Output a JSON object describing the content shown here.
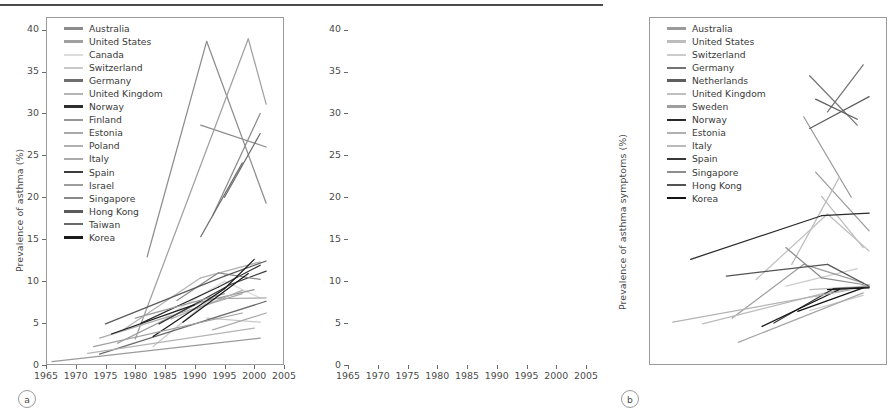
{
  "figure": {
    "panels": [
      "a",
      "b"
    ],
    "tag_a": "a",
    "tag_b": "b",
    "top_rule_color": "#4a4a4a"
  },
  "panel_a": {
    "tag": "a",
    "ylabel": "Prevalence of asthma (%)",
    "xlabel": "",
    "yticks": [
      "0",
      "5",
      "10",
      "15",
      "20",
      "25",
      "30",
      "35",
      "40"
    ],
    "xticks": [
      "1965",
      "1970",
      "1975",
      "1980",
      "1985",
      "1990",
      "1995",
      "2000",
      "2005"
    ],
    "legend": [
      {
        "label": "Australia",
        "color": "#8c8c8c"
      },
      {
        "label": "United States",
        "color": "#a0a0a0"
      },
      {
        "label": "Canada",
        "color": "#dcdcdc"
      },
      {
        "label": "Switzerland",
        "color": "#c8c8c8"
      },
      {
        "label": "Germany",
        "color": "#6e6e6e"
      },
      {
        "label": "United Kingdom",
        "color": "#b4b4b4"
      },
      {
        "label": "Norway",
        "color": "#2e2e2e"
      },
      {
        "label": "Finland",
        "color": "#969696"
      },
      {
        "label": "Estonia",
        "color": "#a8a8a8"
      },
      {
        "label": "Poland",
        "color": "#b0b0b0"
      },
      {
        "label": "Italy",
        "color": "#aaaaaa"
      },
      {
        "label": "Spain",
        "color": "#3c3c3c"
      },
      {
        "label": "Israel",
        "color": "#9c9c9c"
      },
      {
        "label": "Singapore",
        "color": "#8a8a8a"
      },
      {
        "label": "Hong Kong",
        "color": "#5a5a5a"
      },
      {
        "label": "Taiwan",
        "color": "#6a6a6a"
      },
      {
        "label": "Korea",
        "color": "#1a1a1a"
      }
    ]
  },
  "panel_b": {
    "tag": "b",
    "ylabel": "Prevalence of asthma symptoms (%)",
    "xlabel": "",
    "yticks": [
      "0",
      "5",
      "10",
      "15",
      "20",
      "25",
      "30",
      "35",
      "40"
    ],
    "xticks": [
      "1965",
      "1970",
      "1975",
      "1980",
      "1985",
      "1990",
      "1995",
      "2000",
      "2005"
    ],
    "legend": [
      {
        "label": "Australia",
        "color": "#9a9a9a"
      },
      {
        "label": "United States",
        "color": "#bcbcbc"
      },
      {
        "label": "Switzerland",
        "color": "#cccccc"
      },
      {
        "label": "Germany",
        "color": "#747474"
      },
      {
        "label": "Netherlands",
        "color": "#5e5e5e"
      },
      {
        "label": "United Kingdom",
        "color": "#c0c0c0"
      },
      {
        "label": "Sweden",
        "color": "#9e9e9e"
      },
      {
        "label": "Norway",
        "color": "#2a2a2a"
      },
      {
        "label": "Estonia",
        "color": "#b0b0b0"
      },
      {
        "label": "Italy",
        "color": "#bababa"
      },
      {
        "label": "Spain",
        "color": "#383838"
      },
      {
        "label": "Singapore",
        "color": "#8e8e8e"
      },
      {
        "label": "Hong Kong",
        "color": "#525252"
      },
      {
        "label": "Korea",
        "color": "#141414"
      }
    ]
  },
  "chart_data": [
    {
      "type": "line",
      "panel": "a",
      "title": "",
      "xlabel": "",
      "ylabel": "Prevalence of asthma (%)",
      "xlim": [
        1965,
        2005
      ],
      "ylim": [
        0,
        41.5
      ],
      "grid": false,
      "legend_position": "upper-left",
      "series": [
        {
          "name": "Australia",
          "color": "#8c8c8c",
          "x": [
            1982,
            1992
          ],
          "y": [
            12.9,
            38.6
          ]
        },
        {
          "name": "Australia",
          "color": "#8c8c8c",
          "x": [
            1992,
            2002
          ],
          "y": [
            38.6,
            19.3
          ]
        },
        {
          "name": "Australia",
          "color": "#8c8c8c",
          "x": [
            1991,
            2002
          ],
          "y": [
            28.6,
            26.0
          ]
        },
        {
          "name": "Australia",
          "color": "#8c8c8c",
          "x": [
            1993,
            2001
          ],
          "y": [
            17.8,
            30.0
          ]
        },
        {
          "name": "United States",
          "color": "#a0a0a0",
          "x": [
            1980,
            1999
          ],
          "y": [
            3.1,
            38.9
          ]
        },
        {
          "name": "United States",
          "color": "#a0a0a0",
          "x": [
            1999,
            2002
          ],
          "y": [
            38.9,
            31.1
          ]
        },
        {
          "name": "Canada",
          "color": "#dcdcdc",
          "x": [
            1985,
            1995
          ],
          "y": [
            5.7,
            10.0
          ]
        },
        {
          "name": "Canada",
          "color": "#dcdcdc",
          "x": [
            1995,
            2001
          ],
          "y": [
            10.0,
            8.0
          ]
        },
        {
          "name": "Switzerland",
          "color": "#c8c8c8",
          "x": [
            1983,
            1995
          ],
          "y": [
            2.2,
            9.2
          ]
        },
        {
          "name": "Switzerland",
          "color": "#c8c8c8",
          "x": [
            1992,
            2001
          ],
          "y": [
            5.6,
            5.1
          ]
        },
        {
          "name": "Germany",
          "color": "#6e6e6e",
          "x": [
            1991,
            1998
          ],
          "y": [
            15.3,
            24.1
          ]
        },
        {
          "name": "Germany",
          "color": "#6e6e6e",
          "x": [
            1995,
            2001
          ],
          "y": [
            20.0,
            27.6
          ]
        },
        {
          "name": "United Kingdom",
          "color": "#b4b4b4",
          "x": [
            1978,
            1991
          ],
          "y": [
            4.2,
            10.4
          ]
        },
        {
          "name": "United Kingdom",
          "color": "#b4b4b4",
          "x": [
            1991,
            2001
          ],
          "y": [
            10.4,
            12.3
          ]
        },
        {
          "name": "Norway",
          "color": "#2e2e2e",
          "x": [
            1981,
            1994
          ],
          "y": [
            5.0,
            9.3
          ]
        },
        {
          "name": "Norway",
          "color": "#2e2e2e",
          "x": [
            1994,
            2001
          ],
          "y": [
            9.3,
            11.9
          ]
        },
        {
          "name": "Finland",
          "color": "#969696",
          "x": [
            1977,
            1991
          ],
          "y": [
            2.6,
            7.5
          ]
        },
        {
          "name": "Finland",
          "color": "#969696",
          "x": [
            1991,
            2000
          ],
          "y": [
            7.5,
            9.0
          ]
        },
        {
          "name": "Estonia",
          "color": "#a8a8a8",
          "x": [
            1993,
            2002
          ],
          "y": [
            4.2,
            6.2
          ]
        },
        {
          "name": "Poland",
          "color": "#b0b0b0",
          "x": [
            1986,
            1998
          ],
          "y": [
            5.5,
            8.9
          ]
        },
        {
          "name": "Italy",
          "color": "#aaaaaa",
          "x": [
            1974,
            1998
          ],
          "y": [
            3.2,
            8.5
          ]
        },
        {
          "name": "Italy",
          "color": "#aaaaaa",
          "x": [
            1992,
            2002
          ],
          "y": [
            7.9,
            8.0
          ]
        },
        {
          "name": "Spain",
          "color": "#3c3c3c",
          "x": [
            1984,
            1996
          ],
          "y": [
            4.9,
            9.6
          ]
        },
        {
          "name": "Spain",
          "color": "#3c3c3c",
          "x": [
            1996,
            2002
          ],
          "y": [
            9.6,
            11.2
          ]
        },
        {
          "name": "Israel",
          "color": "#9c9c9c",
          "x": [
            1980,
            1995
          ],
          "y": [
            5.6,
            8.5
          ]
        },
        {
          "name": "Singapore",
          "color": "#8a8a8a",
          "x": [
            1987,
            1994
          ],
          "y": [
            7.7,
            11.0
          ]
        },
        {
          "name": "Singapore",
          "color": "#8a8a8a",
          "x": [
            1994,
            2001
          ],
          "y": [
            11.0,
            10.2
          ]
        },
        {
          "name": "Hong Kong",
          "color": "#5a5a5a",
          "x": [
            1975,
            1995
          ],
          "y": [
            4.9,
            10.6
          ]
        },
        {
          "name": "Hong Kong",
          "color": "#5a5a5a",
          "x": [
            1995,
            2002
          ],
          "y": [
            10.6,
            12.4
          ]
        },
        {
          "name": "Taiwan",
          "color": "#6a6a6a",
          "x": [
            1974,
            1994
          ],
          "y": [
            1.3,
            5.8
          ]
        },
        {
          "name": "Taiwan",
          "color": "#6a6a6a",
          "x": [
            1994,
            2002
          ],
          "y": [
            5.8,
            7.6
          ]
        },
        {
          "name": "Korea",
          "color": "#1a1a1a",
          "x": [
            1983,
            1995
          ],
          "y": [
            3.4,
            9.1
          ]
        },
        {
          "name": "Korea",
          "color": "#1a1a1a",
          "x": [
            1995,
            2000
          ],
          "y": [
            9.1,
            12.6
          ]
        },
        {
          "name": "Korea",
          "color": "#1a1a1a",
          "x": [
            1988,
            1999
          ],
          "y": [
            5.1,
            10.9
          ]
        },
        {
          "name": "Korea",
          "color": "#1a1a1a",
          "x": [
            1976,
            1990
          ],
          "y": [
            3.7,
            7.2
          ]
        },
        {
          "name": "trend-low",
          "color": "#9a9a9a",
          "x": [
            1966,
            2001
          ],
          "y": [
            0.4,
            3.2
          ]
        },
        {
          "name": "trend-low2",
          "color": "#b4b4b4",
          "x": [
            1972,
            2000
          ],
          "y": [
            1.4,
            4.4
          ]
        },
        {
          "name": "trend-mid",
          "color": "#a0a0a0",
          "x": [
            1973,
            1998
          ],
          "y": [
            2.2,
            6.2
          ]
        }
      ]
    },
    {
      "type": "line",
      "panel": "b",
      "title": "",
      "xlabel": "",
      "ylabel": "Prevalence of asthma symptoms (%)",
      "xlim": [
        1965,
        2005
      ],
      "ylim": [
        0,
        41.5
      ],
      "grid": false,
      "legend_position": "upper-left",
      "series": [
        {
          "name": "Australia",
          "color": "#9a9a9a",
          "x": [
            1991,
            1999
          ],
          "y": [
            29.6,
            20.0
          ]
        },
        {
          "name": "Australia",
          "color": "#9a9a9a",
          "x": [
            1993,
            2002
          ],
          "y": [
            23.0,
            16.0
          ]
        },
        {
          "name": "United States",
          "color": "#bcbcbc",
          "x": [
            1989,
            1997
          ],
          "y": [
            12.0,
            22.4
          ]
        },
        {
          "name": "United States",
          "color": "#bcbcbc",
          "x": [
            1994,
            2001
          ],
          "y": [
            20.1,
            14.0
          ]
        },
        {
          "name": "Switzerland",
          "color": "#cccccc",
          "x": [
            1988,
            2000
          ],
          "y": [
            9.4,
            11.5
          ]
        },
        {
          "name": "Switzerland",
          "color": "#cccccc",
          "x": [
            1992,
            2001
          ],
          "y": [
            6.5,
            8.3
          ]
        },
        {
          "name": "Germany",
          "color": "#747474",
          "x": [
            1992,
            2000
          ],
          "y": [
            34.5,
            28.6
          ]
        },
        {
          "name": "Germany",
          "color": "#747474",
          "x": [
            1995,
            2001
          ],
          "y": [
            30.2,
            35.8
          ]
        },
        {
          "name": "Netherlands",
          "color": "#5e5e5e",
          "x": [
            1993,
            2000
          ],
          "y": [
            31.7,
            29.3
          ]
        },
        {
          "name": "Netherlands",
          "color": "#5e5e5e",
          "x": [
            1992,
            2002
          ],
          "y": [
            28.2,
            32.0
          ]
        },
        {
          "name": "United Kingdom",
          "color": "#c0c0c0",
          "x": [
            1983,
            1995
          ],
          "y": [
            10.2,
            18.0
          ]
        },
        {
          "name": "United Kingdom",
          "color": "#c0c0c0",
          "x": [
            1995,
            2002
          ],
          "y": [
            18.0,
            13.6
          ]
        },
        {
          "name": "Sweden",
          "color": "#9e9e9e",
          "x": [
            1979,
            1991
          ],
          "y": [
            5.6,
            12.0
          ]
        },
        {
          "name": "Sweden",
          "color": "#9e9e9e",
          "x": [
            1991,
            2001
          ],
          "y": [
            12.0,
            9.8
          ]
        },
        {
          "name": "Norway",
          "color": "#2a2a2a",
          "x": [
            1972,
            1994
          ],
          "y": [
            12.6,
            17.8
          ]
        },
        {
          "name": "Norway",
          "color": "#2a2a2a",
          "x": [
            1994,
            2002
          ],
          "y": [
            17.8,
            18.1
          ]
        },
        {
          "name": "Estonia",
          "color": "#b0b0b0",
          "x": [
            1993,
            2002
          ],
          "y": [
            8.2,
            9.6
          ]
        },
        {
          "name": "Italy",
          "color": "#bababa",
          "x": [
            1974,
            1998
          ],
          "y": [
            4.9,
            9.2
          ]
        },
        {
          "name": "Italy",
          "color": "#bababa",
          "x": [
            1992,
            2002
          ],
          "y": [
            9.0,
            9.4
          ]
        },
        {
          "name": "Spain",
          "color": "#383838",
          "x": [
            1986,
            1996
          ],
          "y": [
            5.0,
            9.1
          ]
        },
        {
          "name": "Spain",
          "color": "#383838",
          "x": [
            1996,
            2002
          ],
          "y": [
            9.1,
            9.3
          ]
        },
        {
          "name": "Singapore",
          "color": "#8e8e8e",
          "x": [
            1988,
            1994
          ],
          "y": [
            14.0,
            10.4
          ]
        },
        {
          "name": "Singapore",
          "color": "#8e8e8e",
          "x": [
            1994,
            2001
          ],
          "y": [
            10.4,
            9.6
          ]
        },
        {
          "name": "Hong Kong",
          "color": "#525252",
          "x": [
            1978,
            1995
          ],
          "y": [
            10.6,
            12.0
          ]
        },
        {
          "name": "Hong Kong",
          "color": "#525252",
          "x": [
            1995,
            2002
          ],
          "y": [
            12.0,
            9.4
          ]
        },
        {
          "name": "Korea",
          "color": "#141414",
          "x": [
            1984,
            1997
          ],
          "y": [
            4.6,
            9.0
          ]
        },
        {
          "name": "Korea",
          "color": "#141414",
          "x": [
            1990,
            2001
          ],
          "y": [
            6.4,
            9.2
          ]
        },
        {
          "name": "Korea",
          "color": "#141414",
          "x": [
            1995,
            2002
          ],
          "y": [
            9.0,
            9.2
          ]
        },
        {
          "name": "trend-low",
          "color": "#b4b4b4",
          "x": [
            1969,
            1999
          ],
          "y": [
            5.1,
            9.0
          ]
        },
        {
          "name": "trend-low2",
          "color": "#a8a8a8",
          "x": [
            1980,
            2001
          ],
          "y": [
            2.7,
            8.6
          ]
        }
      ]
    }
  ]
}
